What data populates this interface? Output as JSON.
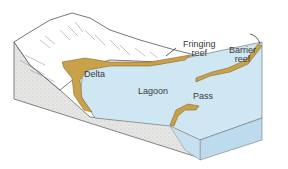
{
  "diagram": {
    "labels": {
      "fringing_reef": [
        "Fringing",
        "reef"
      ],
      "barrier_reef": [
        "Barrier",
        "reef"
      ],
      "delta": "Delta",
      "lagoon": "Lagoon",
      "pass": "Pass"
    },
    "colors": {
      "water": "#cfe6f3",
      "water_side": "#bcdcee",
      "reef": "#c9a14a",
      "reef_dark": "#8a6a28",
      "rock": "#e4e4e2",
      "outline": "#555555"
    }
  }
}
